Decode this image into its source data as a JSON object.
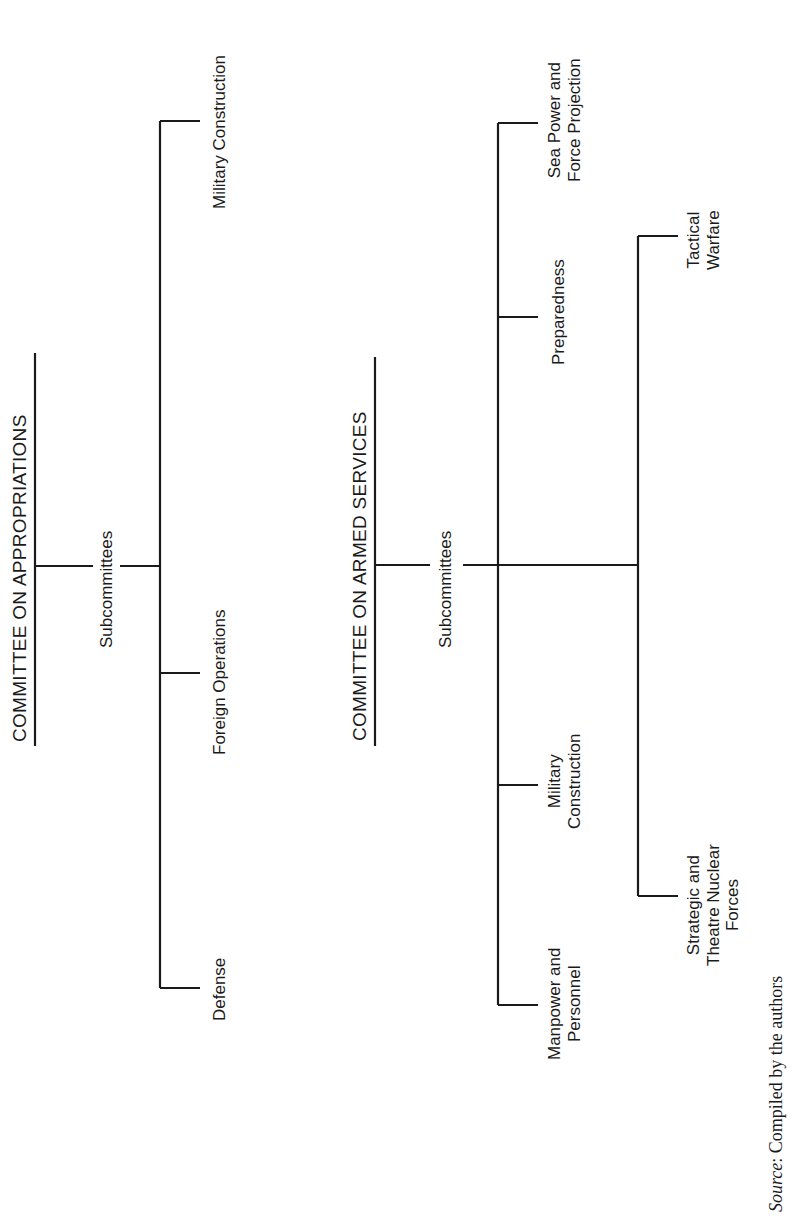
{
  "diagram": {
    "orientation": "rotated-90-ccw",
    "appropriations": {
      "title": "COMMITTEE ON APPROPRIATIONS",
      "sub_label": "Subcommittees",
      "subcommittees": [
        {
          "label": "Military Construction"
        },
        {
          "label": "Foreign Operations"
        },
        {
          "label": "Defense"
        }
      ]
    },
    "armed_services": {
      "title": "COMMITTEE ON ARMED SERVICES",
      "sub_label": "Subcommittees",
      "subcommittees_group1": [
        {
          "line1": "Sea Power and",
          "line2": "Force Projection"
        },
        {
          "line1": "Preparedness",
          "line2": ""
        },
        {
          "line1": "Military",
          "line2": "Construction"
        },
        {
          "line1": "Manpower and",
          "line2": "Personnel"
        }
      ],
      "subcommittees_group2": [
        {
          "line1": "Tactical",
          "line2": "Warfare",
          "line3": ""
        },
        {
          "line1": "Strategic and",
          "line2": "Theatre Nuclear",
          "line3": "Forces"
        }
      ]
    },
    "source": {
      "label": "Source",
      "text": ": Compiled by the authors"
    }
  }
}
